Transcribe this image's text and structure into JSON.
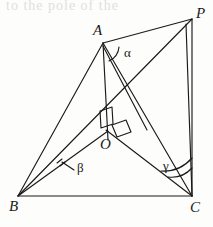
{
  "figure": {
    "kind": "geometry-diagram",
    "stroke_color": "#1a1a1a",
    "background_color": "#fdfdfc",
    "width": 213,
    "height": 227,
    "cut_off_header_text": "to the pole of the",
    "vertices": [
      {
        "id": "P",
        "label": "P",
        "x": 192,
        "y": 19,
        "label_x": 196,
        "label_y": 6
      },
      {
        "id": "A",
        "label": "A",
        "x": 103,
        "y": 43,
        "label_x": 93,
        "label_y": 23
      },
      {
        "id": "O",
        "label": "O",
        "x": 107,
        "y": 133,
        "label_x": 100,
        "label_y": 137
      },
      {
        "id": "B",
        "label": "B",
        "x": 18,
        "y": 196,
        "label_x": 9,
        "label_y": 199
      },
      {
        "id": "C",
        "label": "C",
        "x": 192,
        "y": 196,
        "label_x": 190,
        "label_y": 200
      }
    ],
    "edges": [
      {
        "name": "B-C",
        "from": "B",
        "to": "C"
      },
      {
        "name": "B-A",
        "from": "B",
        "to": "A"
      },
      {
        "name": "A-P",
        "from": "A",
        "to": "P"
      },
      {
        "name": "P-C",
        "from": "P",
        "to": "C"
      },
      {
        "name": "B-P",
        "from": "B",
        "to": "P"
      },
      {
        "name": "A-C",
        "from": "A",
        "to": "C"
      },
      {
        "name": "A-O",
        "from": "A",
        "to": "O"
      },
      {
        "name": "O-C",
        "from": "O",
        "to": "C"
      },
      {
        "name": "B-O-extended",
        "from": "B",
        "to": "P"
      }
    ],
    "angles": [
      {
        "id": "alpha",
        "label": "α",
        "at_vertex": "A",
        "label_x": 124,
        "label_y": 46,
        "arc_count": 1
      },
      {
        "id": "beta",
        "label": "β",
        "at_vertex": "B",
        "label_x": 77,
        "label_y": 161,
        "arc_count": 1,
        "has_leader_line": true
      },
      {
        "id": "gamma",
        "label": "γ",
        "at_vertex": "C",
        "label_x": 163,
        "label_y": 159,
        "arc_count": 2
      }
    ],
    "right_angle_marks": [
      {
        "id": "right-angle-upper",
        "near": "O",
        "orientation": "on segment A-O"
      },
      {
        "id": "right-angle-lower",
        "near": "O",
        "orientation": "on segment O-C"
      }
    ]
  }
}
